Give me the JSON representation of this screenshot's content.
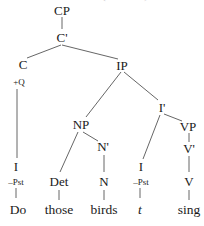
{
  "header": {
    "clipped_text": "(structure)"
  },
  "tree": {
    "nodes": {
      "CP": {
        "label": "CP"
      },
      "Cbar": {
        "label": "C'"
      },
      "C": {
        "label": "C",
        "feature": "+Q"
      },
      "IP": {
        "label": "IP"
      },
      "Ibar": {
        "label": "I'"
      },
      "I_moved": {
        "label": "I",
        "feature": "–Pst",
        "word": "Do"
      },
      "NP": {
        "label": "NP"
      },
      "Det": {
        "label": "Det",
        "word": "those"
      },
      "Nbar": {
        "label": "N'"
      },
      "N": {
        "label": "N",
        "word": "birds"
      },
      "I_trace": {
        "label": "I",
        "feature": "–Pst",
        "word": "t"
      },
      "VP": {
        "label": "VP"
      },
      "Vbar": {
        "label": "V'"
      },
      "V": {
        "label": "V",
        "word": "sing"
      }
    },
    "sentence": [
      "Do",
      "those",
      "birds",
      "t",
      "sing"
    ]
  }
}
